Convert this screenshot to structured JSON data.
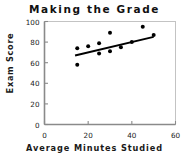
{
  "chart_data": {
    "type": "scatter",
    "title": "Making  the  Grade",
    "xlabel": "Average  Minutes  Studied",
    "ylabel": "Exam Score",
    "xlim": [
      0,
      60
    ],
    "ylim": [
      0,
      100
    ],
    "xticks": [
      0,
      20,
      40,
      60
    ],
    "yticks": [
      0,
      20,
      40,
      60,
      80,
      100
    ],
    "grid": false,
    "legend": null,
    "marker_color": "#000000",
    "line_color": "#000000",
    "axis_color": "#888888",
    "points": [
      {
        "x": 15,
        "y": 74
      },
      {
        "x": 15,
        "y": 58
      },
      {
        "x": 20,
        "y": 76
      },
      {
        "x": 25,
        "y": 79
      },
      {
        "x": 25,
        "y": 69
      },
      {
        "x": 30,
        "y": 89
      },
      {
        "x": 30,
        "y": 71
      },
      {
        "x": 35,
        "y": 75
      },
      {
        "x": 40,
        "y": 80
      },
      {
        "x": 45,
        "y": 95
      },
      {
        "x": 50,
        "y": 87
      }
    ],
    "trendline": {
      "x_start": 14,
      "y_start": 67,
      "x_end": 50,
      "y_end": 85
    }
  }
}
